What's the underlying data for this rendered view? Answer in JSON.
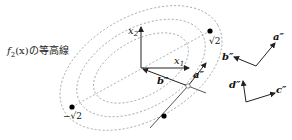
{
  "caption": {
    "func": "f",
    "sub": "2",
    "arg": "(x)",
    "suffix": "の等高線"
  },
  "axes": {
    "x1_label": "x",
    "x1_sub": "1",
    "x2_label": "x",
    "x2_sub": "2"
  },
  "points": {
    "pos_label": "√2",
    "neg_label": "−√2"
  },
  "vectors": {
    "a": "a″",
    "b": "b″",
    "c": "c″",
    "d": "d″"
  },
  "colors": {
    "stroke": "#333333",
    "dashed": "#9a9a9a",
    "dot": "#000000"
  }
}
